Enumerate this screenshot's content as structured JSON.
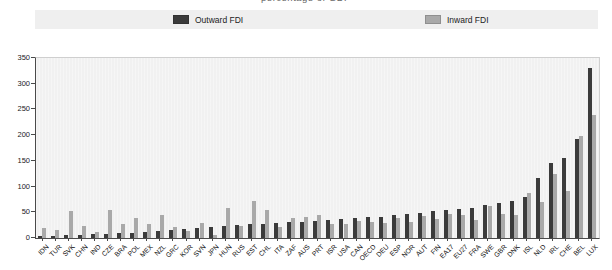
{
  "clipped_caption": "percentage of GDP",
  "legend": {
    "items": [
      {
        "label": "Outward FDI",
        "color": "#3b3b3b"
      },
      {
        "label": "Inward FDI",
        "color": "#a9a9a9"
      }
    ]
  },
  "colors": {
    "outward_bar": "#3b3b3b",
    "inward_bar": "#a9a9a9",
    "plot_background": "#f1f1f1",
    "legend_background": "#efefef",
    "axis": "#4a4a4a"
  },
  "chart_data": {
    "type": "bar",
    "title": "",
    "xlabel": "",
    "ylabel": "",
    "ylim": [
      0,
      350
    ],
    "yticks": [
      0,
      50,
      100,
      150,
      200,
      250,
      300,
      350
    ],
    "grid": false,
    "legend_position": "top",
    "categories": [
      "IDN",
      "TUR",
      "SVK",
      "CHN",
      "IND",
      "CZE",
      "BRA",
      "POL",
      "MEX",
      "NZL",
      "GRC",
      "KOR",
      "SVN",
      "JPN",
      "HUN",
      "RUS",
      "EST",
      "CHL",
      "ITA",
      "ZAF",
      "AUS",
      "PRT",
      "ISR",
      "USA",
      "CAN",
      "OECD",
      "DEU",
      "ESP",
      "NOR",
      "AUT",
      "FIN",
      "EA17",
      "EU27",
      "FRA",
      "SWE",
      "GBR",
      "DNK",
      "ISL",
      "NLD",
      "IRL",
      "CHE",
      "BEL",
      "LUX"
    ],
    "series": [
      {
        "name": "Outward FDI",
        "values": [
          3,
          3,
          5,
          6,
          7,
          8,
          9,
          10,
          11,
          13,
          16,
          18,
          20,
          22,
          24,
          26,
          27,
          28,
          29,
          31,
          32,
          34,
          35,
          37,
          38,
          40,
          41,
          44,
          46,
          49,
          53,
          55,
          57,
          59,
          65,
          68,
          72,
          80,
          116,
          145,
          156,
          192,
          330
        ]
      },
      {
        "name": "Inward FDI",
        "values": [
          19,
          15,
          52,
          23,
          12,
          55,
          28,
          39,
          28,
          44,
          22,
          14,
          30,
          5,
          58,
          24,
          72,
          55,
          21,
          38,
          41,
          44,
          27,
          28,
          34,
          32,
          29,
          38,
          31,
          43,
          37,
          46,
          44,
          36,
          63,
          46,
          44,
          88,
          70,
          124,
          92,
          198,
          240
        ]
      }
    ]
  }
}
